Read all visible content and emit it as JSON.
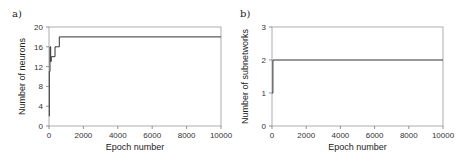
{
  "chart_data": [
    {
      "panel_label": "a)",
      "type": "line",
      "title": "",
      "xlabel": "Epoch number",
      "ylabel": "Number of neurons",
      "xlim": [
        0,
        10000
      ],
      "ylim": [
        0,
        20
      ],
      "xticks": [
        0,
        2000,
        4000,
        6000,
        8000,
        10000
      ],
      "yticks": [
        0,
        4,
        8,
        12,
        16,
        20
      ],
      "grid": false,
      "series": [
        {
          "name": "neurons",
          "x": [
            0,
            20,
            20,
            60,
            60,
            100,
            100,
            130,
            130,
            160,
            160,
            350,
            350,
            480,
            480,
            600,
            600,
            10000
          ],
          "y": [
            2,
            2,
            11,
            11,
            16,
            16,
            13,
            13,
            14,
            14,
            14,
            14,
            16,
            16,
            16,
            16,
            18,
            18
          ]
        }
      ]
    },
    {
      "panel_label": "b)",
      "type": "line",
      "title": "",
      "xlabel": "Epoch number",
      "ylabel": "Number of subnetworks",
      "xlim": [
        0,
        10000
      ],
      "ylim": [
        0,
        3
      ],
      "xticks": [
        0,
        2000,
        4000,
        6000,
        8000,
        10000
      ],
      "yticks": [
        0,
        1,
        2,
        3
      ],
      "grid": false,
      "series": [
        {
          "name": "subnetworks",
          "x": [
            0,
            50,
            50,
            10000
          ],
          "y": [
            1,
            1,
            2,
            2
          ]
        }
      ]
    }
  ]
}
